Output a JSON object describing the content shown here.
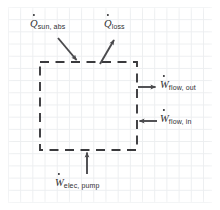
{
  "diagram": {
    "background": {
      "type": "graph-paper",
      "grid_color": "#eceef0",
      "paper_color": "#ffffff",
      "grid_spacing_px": 12
    },
    "control_volume": {
      "name": "dashed-control-volume-boundary",
      "shape": "square",
      "style": "dashed",
      "stroke_color": "#3a3a3d",
      "x": 40,
      "y": 62,
      "width": 97,
      "height": 88
    },
    "ink_color": "#2f2f32",
    "arrows": [
      {
        "id": "q-sun-abs",
        "name": "arrow-q-sun-abs",
        "direction": "into-control-volume",
        "orientation": "down-right",
        "x1": 58,
        "y1": 38,
        "x2": 78,
        "y2": 62
      },
      {
        "id": "q-loss",
        "name": "arrow-q-loss",
        "direction": "out-of-control-volume",
        "orientation": "up-right",
        "x1": 100,
        "y1": 63,
        "x2": 115,
        "y2": 38
      },
      {
        "id": "w-flow-out",
        "name": "arrow-w-flow-out",
        "direction": "out-of-control-volume",
        "orientation": "right",
        "x1": 138,
        "y1": 87,
        "x2": 157,
        "y2": 87
      },
      {
        "id": "w-flow-in",
        "name": "arrow-w-flow-in",
        "direction": "into-control-volume",
        "orientation": "left",
        "x1": 157,
        "y1": 121,
        "x2": 138,
        "y2": 121
      },
      {
        "id": "w-elec-pump",
        "name": "arrow-w-elec-pump",
        "direction": "into-control-volume",
        "orientation": "up",
        "x1": 87,
        "y1": 174,
        "x2": 87,
        "y2": 151
      }
    ],
    "labels": {
      "q_sun_abs": {
        "symbol": "Q",
        "overdot": true,
        "subscript": "sun, abs"
      },
      "q_loss": {
        "symbol": "Q",
        "overdot": true,
        "subscript": "loss"
      },
      "w_flow_out": {
        "symbol": "W",
        "overdot": true,
        "subscript": "flow, out"
      },
      "w_flow_in": {
        "symbol": "W",
        "overdot": true,
        "subscript": "flow, in"
      },
      "w_elec_pump": {
        "symbol": "W",
        "overdot": true,
        "subscript": "elec, pump"
      }
    }
  }
}
